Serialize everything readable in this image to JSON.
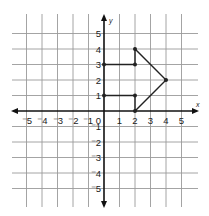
{
  "diagram": {
    "type": "coordinate-plane",
    "x_axis": {
      "label": "x",
      "min": -5,
      "max": 5,
      "ticks": [
        -5,
        -4,
        -3,
        -2,
        -1,
        1,
        2,
        3,
        4,
        5
      ]
    },
    "y_axis": {
      "label": "y",
      "min": -5,
      "max": 5,
      "ticks": [
        5,
        4,
        3,
        2,
        1,
        -1,
        -2,
        -3,
        -4,
        -5
      ]
    },
    "origin_label": "0",
    "tick_labels_x": [
      "⁻5",
      "⁻4",
      "⁻3",
      "⁻2",
      "⁻1",
      "1",
      "2",
      "3",
      "4",
      "5"
    ],
    "tick_labels_y": [
      "5",
      "4",
      "3",
      "2",
      "1",
      "⁻1",
      "⁻2",
      "⁻3",
      "⁻4",
      "⁻5"
    ],
    "shape": {
      "name": "arrow-polygon",
      "vertices": [
        [
          0,
          3
        ],
        [
          2,
          3
        ],
        [
          2,
          4
        ],
        [
          4,
          2
        ],
        [
          2,
          0
        ],
        [
          2,
          1
        ],
        [
          0,
          1
        ]
      ],
      "stroke": "#222222"
    },
    "colors": {
      "grid": "#9a9a9a",
      "axes": "#111111",
      "shape": "#222222",
      "background": "#ffffff"
    }
  }
}
